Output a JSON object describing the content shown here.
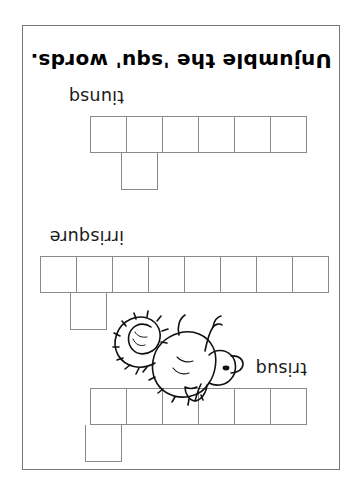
{
  "worksheet": {
    "title": "Unjumble the 'squ' words.",
    "illustration": "squirrel-drawing",
    "orientation": "upside-down",
    "puzzles": [
      {
        "id": "puzzle-squirt",
        "clue": "trisuq",
        "row_cells": 6,
        "riser_index": 5,
        "answer_length": 7
      },
      {
        "id": "puzzle-squirrel",
        "clue": "irrisqure",
        "row_cells": 8,
        "riser_index": 7,
        "answer_length": 9
      },
      {
        "id": "puzzle-squint",
        "clue": "tiunsq",
        "row_cells": 6,
        "riser_index": 5,
        "answer_length": 7
      }
    ]
  }
}
